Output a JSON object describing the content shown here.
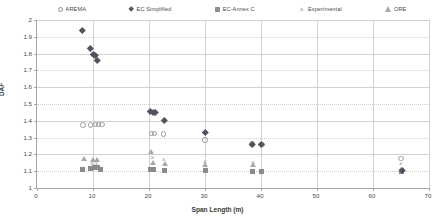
{
  "chart_data": {
    "type": "scatter",
    "title": "",
    "xlabel": "Span Length (m)",
    "ylabel": "DAF",
    "xlim": [
      0,
      70
    ],
    "ylim": [
      1,
      2
    ],
    "xticks": [
      0,
      10,
      20,
      30,
      40,
      50,
      60,
      70
    ],
    "yticks": [
      1,
      1.1,
      1.2,
      1.3,
      1.4,
      1.5,
      1.6,
      1.7,
      1.8,
      1.9,
      2
    ],
    "grid": true,
    "legend_position": "top",
    "series": [
      {
        "name": "AREMA",
        "marker": "open-circle",
        "color": "#9b9b9b",
        "points": [
          {
            "x": 8.2,
            "y": 1.375
          },
          {
            "x": 9.6,
            "y": 1.375
          },
          {
            "x": 10.4,
            "y": 1.378
          },
          {
            "x": 11.0,
            "y": 1.378
          },
          {
            "x": 11.6,
            "y": 1.378
          },
          {
            "x": 20.4,
            "y": 1.325
          },
          {
            "x": 21.0,
            "y": 1.325
          },
          {
            "x": 22.6,
            "y": 1.322
          },
          {
            "x": 30.0,
            "y": 1.285
          },
          {
            "x": 38.4,
            "y": 1.262
          },
          {
            "x": 40.2,
            "y": 1.258
          },
          {
            "x": 65.0,
            "y": 1.175
          }
        ]
      },
      {
        "name": "EC Simplified",
        "marker": "filled-diamond",
        "color": "#53535f",
        "points": [
          {
            "x": 8.0,
            "y": 1.94
          },
          {
            "x": 9.5,
            "y": 1.83
          },
          {
            "x": 10.0,
            "y": 1.795
          },
          {
            "x": 10.4,
            "y": 1.79
          },
          {
            "x": 10.8,
            "y": 1.76
          },
          {
            "x": 20.2,
            "y": 1.455
          },
          {
            "x": 20.8,
            "y": 1.452
          },
          {
            "x": 21.2,
            "y": 1.45
          },
          {
            "x": 22.8,
            "y": 1.405
          },
          {
            "x": 30.0,
            "y": 1.33
          },
          {
            "x": 38.5,
            "y": 1.262
          },
          {
            "x": 40.0,
            "y": 1.258
          },
          {
            "x": 65.2,
            "y": 1.105
          }
        ]
      },
      {
        "name": "EC-Annex C",
        "marker": "filled-square",
        "color": "#8b8b8b",
        "points": [
          {
            "x": 8.2,
            "y": 1.112
          },
          {
            "x": 9.6,
            "y": 1.118
          },
          {
            "x": 10.2,
            "y": 1.122
          },
          {
            "x": 10.8,
            "y": 1.12
          },
          {
            "x": 11.4,
            "y": 1.108
          },
          {
            "x": 20.2,
            "y": 1.11
          },
          {
            "x": 20.8,
            "y": 1.108
          },
          {
            "x": 22.8,
            "y": 1.105
          },
          {
            "x": 30.0,
            "y": 1.102
          },
          {
            "x": 38.5,
            "y": 1.1
          },
          {
            "x": 40.0,
            "y": 1.1
          },
          {
            "x": 65.0,
            "y": 1.098
          }
        ]
      },
      {
        "name": "Experimental",
        "marker": "cross",
        "color": "#9d9d9d",
        "points": [
          {
            "x": 9.8,
            "y": 1.145
          },
          {
            "x": 10.6,
            "y": 1.14
          },
          {
            "x": 20.6,
            "y": 1.18
          },
          {
            "x": 22.6,
            "y": 1.165
          },
          {
            "x": 30.0,
            "y": 1.155
          },
          {
            "x": 38.6,
            "y": 1.15
          },
          {
            "x": 65.0,
            "y": 1.142
          }
        ]
      },
      {
        "name": "ORE",
        "marker": "triangle",
        "color": "#a8a8a8",
        "points": [
          {
            "x": 8.4,
            "y": 1.175
          },
          {
            "x": 10.0,
            "y": 1.172
          },
          {
            "x": 10.8,
            "y": 1.168
          },
          {
            "x": 20.4,
            "y": 1.215
          },
          {
            "x": 20.8,
            "y": 1.15
          },
          {
            "x": 22.8,
            "y": 1.148
          },
          {
            "x": 30.0,
            "y": 1.14
          },
          {
            "x": 38.6,
            "y": 1.138
          },
          {
            "x": 65.0,
            "y": 1.112
          }
        ]
      }
    ]
  },
  "legend": {
    "items": [
      {
        "label": "AREMA",
        "marker": "open-circle-icon"
      },
      {
        "label": "EC Simplified",
        "marker": "filled-diamond-icon"
      },
      {
        "label": "EC-Annex C",
        "marker": "filled-square-icon"
      },
      {
        "label": "Experimental",
        "marker": "cross-icon"
      },
      {
        "label": "ORE",
        "marker": "triangle-icon"
      }
    ]
  },
  "axes": {
    "x_title": "Span Length (m)",
    "y_title": "DAF",
    "x_tick_labels": [
      "0",
      "10",
      "20",
      "30",
      "40",
      "50",
      "60",
      "70"
    ],
    "y_tick_labels": [
      "1",
      "1.1",
      "1.2",
      "1.3",
      "1.4",
      "1.5",
      "1.6",
      "1.7",
      "1.8",
      "1.9",
      "2"
    ]
  }
}
